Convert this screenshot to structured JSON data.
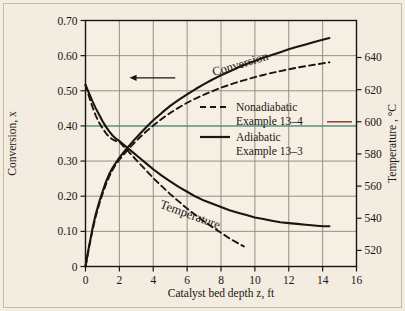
{
  "chart_data": {
    "type": "line",
    "title": "",
    "xlabel": "Catalyst bed depth z, ft",
    "ylabel": "Conversion, x",
    "y2label": "Temperature , °C",
    "xlim": [
      0,
      16
    ],
    "ylim": [
      0,
      0.7
    ],
    "y2lim": [
      510,
      663
    ],
    "grid": true,
    "xticks": [
      "0",
      "2",
      "4",
      "6",
      "8",
      "10",
      "12",
      "14",
      "16"
    ],
    "xtick_values": [
      0,
      2,
      4,
      6,
      8,
      10,
      12,
      14,
      16
    ],
    "yticks": [
      "0",
      "0.10",
      "0.20",
      "0.30",
      "0.40",
      "0.50",
      "0.60",
      "0.70"
    ],
    "ytick_values": [
      0,
      0.1,
      0.2,
      0.3,
      0.4,
      0.5,
      0.6,
      0.7
    ],
    "y2ticks": [
      "520",
      "540",
      "560",
      "580",
      "600",
      "620",
      "640"
    ],
    "y2tick_values": [
      520,
      540,
      560,
      580,
      600,
      620,
      640
    ],
    "annotations": [
      {
        "text": "Conversion",
        "x": 9.2,
        "y": 0.565,
        "rotation": -17
      },
      {
        "text": "Temperature",
        "x": 6.1,
        "y": 0.137,
        "rotation": 20
      }
    ],
    "arrow": {
      "text": "",
      "from_x": 5.3,
      "to_x": 2.6,
      "y": 0.537,
      "direction": "left"
    },
    "reference_line": {
      "y": 0.4,
      "color": "#3f8f82",
      "style": "solid"
    },
    "legend": {
      "position": "center-right",
      "entries": [
        {
          "label_line1": "Nonadiabatic",
          "label_line2": "Example 13–4",
          "style": "dashed"
        },
        {
          "label_line1": "Adiabatic",
          "label_line2": "Example 13–3",
          "style": "solid"
        }
      ]
    },
    "series": [
      {
        "name": "Conversion — Adiabatic (Example 13-3)",
        "style": "solid",
        "axis": "left",
        "color": "#1a1512",
        "points": [
          [
            0.0,
            0.0
          ],
          [
            0.2,
            0.055
          ],
          [
            0.4,
            0.105
          ],
          [
            0.6,
            0.148
          ],
          [
            0.8,
            0.182
          ],
          [
            1.0,
            0.212
          ],
          [
            1.2,
            0.24
          ],
          [
            1.4,
            0.263
          ],
          [
            1.6,
            0.281
          ],
          [
            1.8,
            0.296
          ],
          [
            2.0,
            0.31
          ],
          [
            2.4,
            0.334
          ],
          [
            2.8,
            0.356
          ],
          [
            3.2,
            0.377
          ],
          [
            3.6,
            0.397
          ],
          [
            4.0,
            0.416
          ],
          [
            4.5,
            0.437
          ],
          [
            5.0,
            0.457
          ],
          [
            5.5,
            0.474
          ],
          [
            6.0,
            0.49
          ],
          [
            6.5,
            0.505
          ],
          [
            7.0,
            0.519
          ],
          [
            7.5,
            0.532
          ],
          [
            8.0,
            0.544
          ],
          [
            8.5,
            0.555
          ],
          [
            9.0,
            0.566
          ],
          [
            9.5,
            0.576
          ],
          [
            10.0,
            0.585
          ],
          [
            10.5,
            0.594
          ],
          [
            11.0,
            0.602
          ],
          [
            11.5,
            0.61
          ],
          [
            12.0,
            0.618
          ],
          [
            12.5,
            0.625
          ],
          [
            13.0,
            0.632
          ],
          [
            13.5,
            0.639
          ],
          [
            14.0,
            0.645
          ],
          [
            14.4,
            0.65
          ]
        ]
      },
      {
        "name": "Conversion — Nonadiabatic (Example 13-4)",
        "style": "dashed",
        "axis": "left",
        "color": "#1a1512",
        "points": [
          [
            0.0,
            0.0
          ],
          [
            0.2,
            0.052
          ],
          [
            0.4,
            0.1
          ],
          [
            0.6,
            0.142
          ],
          [
            0.8,
            0.176
          ],
          [
            1.0,
            0.206
          ],
          [
            1.2,
            0.233
          ],
          [
            1.4,
            0.256
          ],
          [
            1.6,
            0.275
          ],
          [
            1.8,
            0.291
          ],
          [
            2.0,
            0.304
          ],
          [
            2.4,
            0.327
          ],
          [
            2.8,
            0.348
          ],
          [
            3.2,
            0.367
          ],
          [
            3.6,
            0.385
          ],
          [
            4.0,
            0.401
          ],
          [
            4.5,
            0.42
          ],
          [
            5.0,
            0.437
          ],
          [
            5.5,
            0.452
          ],
          [
            6.0,
            0.466
          ],
          [
            6.5,
            0.478
          ],
          [
            7.0,
            0.489
          ],
          [
            7.5,
            0.499
          ],
          [
            8.0,
            0.509
          ],
          [
            8.5,
            0.517
          ],
          [
            9.0,
            0.525
          ],
          [
            9.5,
            0.532
          ],
          [
            10.0,
            0.539
          ],
          [
            10.5,
            0.545
          ],
          [
            11.0,
            0.551
          ],
          [
            11.5,
            0.556
          ],
          [
            12.0,
            0.561
          ],
          [
            12.5,
            0.566
          ],
          [
            13.0,
            0.57
          ],
          [
            13.5,
            0.574
          ],
          [
            14.0,
            0.578
          ],
          [
            14.4,
            0.581
          ]
        ]
      },
      {
        "name": "Temperature — Adiabatic (Example 13-3)",
        "style": "solid",
        "axis": "right",
        "color": "#1a1512",
        "points": [
          [
            0.0,
            623.0
          ],
          [
            0.2,
            618.0
          ],
          [
            0.4,
            613.0
          ],
          [
            0.6,
            608.5
          ],
          [
            0.8,
            604.5
          ],
          [
            1.0,
            600.5
          ],
          [
            1.2,
            597.0
          ],
          [
            1.4,
            594.0
          ],
          [
            1.6,
            591.5
          ],
          [
            1.8,
            589.5
          ],
          [
            2.0,
            588.0
          ],
          [
            2.4,
            584.5
          ],
          [
            2.8,
            581.0
          ],
          [
            3.2,
            577.5
          ],
          [
            3.6,
            574.0
          ],
          [
            4.0,
            570.5
          ],
          [
            4.5,
            566.5
          ],
          [
            5.0,
            563.0
          ],
          [
            5.5,
            559.5
          ],
          [
            6.0,
            556.5
          ],
          [
            6.5,
            553.5
          ],
          [
            7.0,
            551.0
          ],
          [
            7.5,
            549.0
          ],
          [
            8.0,
            547.0
          ],
          [
            8.5,
            545.0
          ],
          [
            9.0,
            543.5
          ],
          [
            9.5,
            542.0
          ],
          [
            10.0,
            540.5
          ],
          [
            10.5,
            539.5
          ],
          [
            11.0,
            538.5
          ],
          [
            11.5,
            537.5
          ],
          [
            12.0,
            537.0
          ],
          [
            12.5,
            536.5
          ],
          [
            13.0,
            536.0
          ],
          [
            13.5,
            535.5
          ],
          [
            14.0,
            535.0
          ],
          [
            14.4,
            535.0
          ]
        ]
      },
      {
        "name": "Temperature — Nonadiabatic (Example 13-4)",
        "style": "dashed",
        "axis": "right",
        "color": "#1a1512",
        "points": [
          [
            0.0,
            623.0
          ],
          [
            0.2,
            616.0
          ],
          [
            0.4,
            609.5
          ],
          [
            0.6,
            604.0
          ],
          [
            0.8,
            599.5
          ],
          [
            1.0,
            596.0
          ],
          [
            1.2,
            593.0
          ],
          [
            1.4,
            590.5
          ],
          [
            1.6,
            589.0
          ],
          [
            1.8,
            588.0
          ],
          [
            2.0,
            587.5
          ],
          [
            2.4,
            583.0
          ],
          [
            2.8,
            578.5
          ],
          [
            3.2,
            574.0
          ],
          [
            3.6,
            569.5
          ],
          [
            4.0,
            565.0
          ],
          [
            4.5,
            560.0
          ],
          [
            5.0,
            555.0
          ],
          [
            5.5,
            550.5
          ],
          [
            6.0,
            546.0
          ],
          [
            6.5,
            542.0
          ],
          [
            7.0,
            538.0
          ],
          [
            7.5,
            534.5
          ],
          [
            8.0,
            531.0
          ],
          [
            8.5,
            527.5
          ],
          [
            9.0,
            524.5
          ],
          [
            9.35,
            522.5
          ]
        ]
      }
    ]
  }
}
